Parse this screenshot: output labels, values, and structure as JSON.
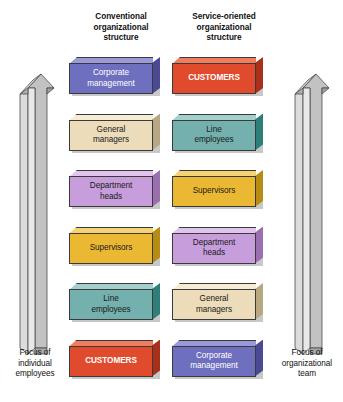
{
  "diagram": {
    "title_left": "Conventional organizational structure",
    "title_right": "Service-oriented organizational structure",
    "headers": {
      "left": {
        "line1": "Conventional",
        "line2": "organizational",
        "line3": "structure"
      },
      "right": {
        "line1": "Service-oriented",
        "line2": "organizational",
        "line3": "structure"
      }
    },
    "arrows": {
      "left": {
        "direction": "up",
        "caption_line1": "Focus of",
        "caption_line2": "individual",
        "caption_line3": "employees",
        "body_color": "#d2d2d2",
        "side_color": "#9d9d9d"
      },
      "right": {
        "direction": "up",
        "caption_line1": "Focus of",
        "caption_line2": "organizational",
        "caption_line3": "team",
        "body_color": "#d2d2d2",
        "side_color": "#9d9d9d"
      }
    },
    "columns": [
      {
        "id": "conventional",
        "boxes": [
          {
            "label_line1": "Corporate",
            "label_line2": "management",
            "face": "#6f6fc0",
            "top": "#9a9ad8",
            "side": "#4a4a93",
            "text": "#ffffff",
            "bold": false
          },
          {
            "label_line1": "General",
            "label_line2": "managers",
            "face": "#ecdcba",
            "top": "#f6ecd6",
            "side": "#b8a882",
            "text": "#1a1a1a",
            "bold": false
          },
          {
            "label_line1": "Department",
            "label_line2": "heads",
            "face": "#c79ddc",
            "top": "#e0c4ee",
            "side": "#9a6fb0",
            "text": "#1a1a1a",
            "bold": false
          },
          {
            "label_line1": "Supervisors",
            "label_line2": "",
            "face": "#eab833",
            "top": "#f5d273",
            "side": "#b88c12",
            "text": "#1a1a1a",
            "bold": false
          },
          {
            "label_line1": "Line",
            "label_line2": "employees",
            "face": "#74b0ad",
            "top": "#a3cfcc",
            "side": "#2d7f78",
            "text": "#1a1a1a",
            "bold": false
          },
          {
            "label_line1": "CUSTOMERS",
            "label_line2": "",
            "face": "#e04b2e",
            "top": "#ef7d5e",
            "side": "#a8301a",
            "text": "#ffffff",
            "bold": true
          }
        ]
      },
      {
        "id": "service-oriented",
        "boxes": [
          {
            "label_line1": "CUSTOMERS",
            "label_line2": "",
            "face": "#e04b2e",
            "top": "#ef7d5e",
            "side": "#a8301a",
            "text": "#ffffff",
            "bold": true
          },
          {
            "label_line1": "Line",
            "label_line2": "employees",
            "face": "#74b0ad",
            "top": "#a3cfcc",
            "side": "#2d7f78",
            "text": "#1a1a1a",
            "bold": false
          },
          {
            "label_line1": "Supervisors",
            "label_line2": "",
            "face": "#eab833",
            "top": "#f5d273",
            "side": "#b88c12",
            "text": "#1a1a1a",
            "bold": false
          },
          {
            "label_line1": "Department",
            "label_line2": "heads",
            "face": "#c79ddc",
            "top": "#e0c4ee",
            "side": "#9a6fb0",
            "text": "#1a1a1a",
            "bold": false
          },
          {
            "label_line1": "General",
            "label_line2": "managers",
            "face": "#ecdcba",
            "top": "#f6ecd6",
            "side": "#b8a882",
            "text": "#1a1a1a",
            "bold": false
          },
          {
            "label_line1": "Corporate",
            "label_line2": "management",
            "face": "#6f6fc0",
            "top": "#9a9ad8",
            "side": "#4a4a93",
            "text": "#ffffff",
            "bold": false
          }
        ]
      }
    ]
  }
}
